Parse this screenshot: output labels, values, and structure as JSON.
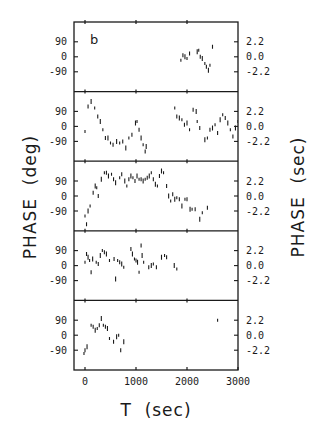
{
  "chart_data": {
    "type": "scatter",
    "panel_letter": "b",
    "xlabel": "T  (sec)",
    "ylabel_left": "PHASE  (deg)",
    "ylabel_right": "PHASE  (sec)",
    "xlim": [
      -200,
      3000
    ],
    "x_ticks": [
      0,
      1000,
      2000,
      3000
    ],
    "ylim_left": [
      -180,
      180
    ],
    "y_ticks_left": [
      "90",
      "0",
      "-90"
    ],
    "y_ticks_right": [
      "2.2",
      "0.0",
      "-2.2"
    ],
    "grid": false,
    "legend": null,
    "panels": [
      {
        "name": "panel-1",
        "points": [
          [
            1880,
            -20
          ],
          [
            1920,
            10
          ],
          [
            1960,
            0
          ],
          [
            2000,
            -10
          ],
          [
            2050,
            20
          ],
          [
            2200,
            30
          ],
          [
            2230,
            40
          ],
          [
            2260,
            0
          ],
          [
            2300,
            -10
          ],
          [
            2350,
            -40
          ],
          [
            2380,
            -60
          ],
          [
            2420,
            -80
          ],
          [
            2450,
            -50
          ],
          [
            2500,
            60
          ]
        ]
      },
      {
        "name": "panel-2",
        "points": [
          [
            0,
            -30
          ],
          [
            60,
            120
          ],
          [
            120,
            150
          ],
          [
            190,
            110
          ],
          [
            250,
            60
          ],
          [
            300,
            30
          ],
          [
            350,
            -20
          ],
          [
            400,
            -70
          ],
          [
            450,
            -70
          ],
          [
            500,
            -100
          ],
          [
            550,
            -110
          ],
          [
            620,
            -90
          ],
          [
            680,
            -100
          ],
          [
            740,
            -90
          ],
          [
            800,
            -130
          ],
          [
            860,
            -70
          ],
          [
            920,
            -50
          ],
          [
            990,
            20
          ],
          [
            1020,
            30
          ],
          [
            1060,
            -20
          ],
          [
            1100,
            -70
          ],
          [
            1140,
            -110
          ],
          [
            1180,
            -150
          ],
          [
            1200,
            -120
          ],
          [
            1760,
            110
          ],
          [
            1800,
            60
          ],
          [
            1850,
            50
          ],
          [
            1900,
            40
          ],
          [
            1950,
            10
          ],
          [
            2000,
            20
          ],
          [
            2050,
            -20
          ],
          [
            2120,
            100
          ],
          [
            2180,
            90
          ],
          [
            2200,
            30
          ],
          [
            2250,
            -10
          ],
          [
            2350,
            -80
          ],
          [
            2400,
            -70
          ],
          [
            2450,
            -20
          ],
          [
            2500,
            -10
          ],
          [
            2550,
            10
          ],
          [
            2600,
            -40
          ],
          [
            2650,
            40
          ],
          [
            2700,
            70
          ],
          [
            2750,
            50
          ],
          [
            2800,
            20
          ],
          [
            2850,
            -20
          ],
          [
            2900,
            -60
          ],
          [
            2950,
            -10
          ],
          [
            3000,
            30
          ],
          [
            3050,
            80
          ]
        ]
      },
      {
        "name": "panel-3",
        "points": [
          [
            0,
            -120
          ],
          [
            30,
            -170
          ],
          [
            60,
            -90
          ],
          [
            100,
            -60
          ],
          [
            160,
            20
          ],
          [
            200,
            60
          ],
          [
            230,
            50
          ],
          [
            260,
            0
          ],
          [
            320,
            100
          ],
          [
            380,
            140
          ],
          [
            420,
            140
          ],
          [
            460,
            120
          ],
          [
            520,
            130
          ],
          [
            560,
            100
          ],
          [
            600,
            80
          ],
          [
            680,
            110
          ],
          [
            720,
            130
          ],
          [
            780,
            90
          ],
          [
            820,
            60
          ],
          [
            860,
            100
          ],
          [
            900,
            120
          ],
          [
            940,
            110
          ],
          [
            980,
            90
          ],
          [
            1020,
            120
          ],
          [
            1060,
            100
          ],
          [
            1100,
            100
          ],
          [
            1140,
            90
          ],
          [
            1180,
            100
          ],
          [
            1220,
            110
          ],
          [
            1260,
            120
          ],
          [
            1300,
            140
          ],
          [
            1340,
            100
          ],
          [
            1380,
            70
          ],
          [
            1420,
            60
          ],
          [
            1460,
            120
          ],
          [
            1500,
            150
          ],
          [
            1540,
            140
          ],
          [
            1600,
            60
          ],
          [
            1640,
            0
          ],
          [
            1680,
            -30
          ],
          [
            1720,
            10
          ],
          [
            1760,
            -20
          ],
          [
            1800,
            -10
          ],
          [
            1850,
            -20
          ],
          [
            1900,
            -60
          ],
          [
            1960,
            -20
          ],
          [
            2000,
            -20
          ],
          [
            2060,
            -80
          ],
          [
            2100,
            -80
          ],
          [
            2160,
            -80
          ],
          [
            2250,
            -140
          ],
          [
            2300,
            -100
          ],
          [
            2400,
            -70
          ]
        ]
      },
      {
        "name": "panel-4",
        "points": [
          [
            0,
            20
          ],
          [
            30,
            70
          ],
          [
            60,
            50
          ],
          [
            90,
            30
          ],
          [
            120,
            -40
          ],
          [
            150,
            40
          ],
          [
            220,
            20
          ],
          [
            260,
            10
          ],
          [
            300,
            60
          ],
          [
            340,
            90
          ],
          [
            380,
            80
          ],
          [
            420,
            70
          ],
          [
            480,
            30
          ],
          [
            570,
            40
          ],
          [
            600,
            -80
          ],
          [
            640,
            30
          ],
          [
            680,
            20
          ],
          [
            720,
            10
          ],
          [
            760,
            -10
          ],
          [
            900,
            100
          ],
          [
            930,
            70
          ],
          [
            970,
            40
          ],
          [
            1000,
            30
          ],
          [
            1030,
            20
          ],
          [
            1060,
            -40
          ],
          [
            1100,
            120
          ],
          [
            1120,
            60
          ],
          [
            1150,
            20
          ],
          [
            1250,
            -10
          ],
          [
            1300,
            0
          ],
          [
            1340,
            10
          ],
          [
            1400,
            -10
          ],
          [
            1500,
            50
          ],
          [
            1560,
            60
          ],
          [
            1600,
            50
          ],
          [
            1750,
            0
          ],
          [
            1800,
            -20
          ]
        ]
      },
      {
        "name": "panel-5",
        "points": [
          [
            -20,
            -110
          ],
          [
            0,
            -90
          ],
          [
            40,
            -70
          ],
          [
            120,
            60
          ],
          [
            160,
            50
          ],
          [
            200,
            30
          ],
          [
            240,
            40
          ],
          [
            280,
            60
          ],
          [
            320,
            100
          ],
          [
            360,
            60
          ],
          [
            400,
            50
          ],
          [
            440,
            40
          ],
          [
            480,
            -20
          ],
          [
            560,
            -40
          ],
          [
            620,
            -10
          ],
          [
            660,
            0
          ],
          [
            700,
            -90
          ],
          [
            760,
            -40
          ],
          [
            2600,
            90
          ]
        ]
      }
    ]
  },
  "labels": {
    "panel_letter": "b",
    "x_title": "T  (sec)",
    "y_left_title": "PHASE  (deg)",
    "y_right_title": "PHASE  (sec)",
    "x_tick_labels": [
      "0",
      "1000",
      "2000",
      "3000"
    ],
    "y_left_tick_labels": [
      "90",
      "0",
      "-90"
    ],
    "y_right_tick_labels": [
      "2.2",
      "0.0",
      "-2.2"
    ]
  }
}
